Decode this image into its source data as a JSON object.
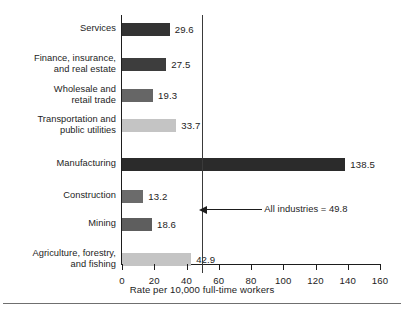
{
  "chart_data": {
    "type": "bar",
    "orientation": "horizontal",
    "title": "",
    "xlabel": "Rate per 10,000 full-time workers",
    "ylabel": "",
    "xlim": [
      0,
      160
    ],
    "xticks": [
      0,
      20,
      40,
      60,
      80,
      100,
      120,
      140,
      160
    ],
    "xtick_labels": [
      "0",
      "20",
      "40",
      "60",
      "80",
      "100",
      "120",
      "140",
      "160"
    ],
    "grid": false,
    "legend": null,
    "categories": [
      "Services",
      "Finance, insurance,\nand real estate",
      "Wholesale and\nretail trade",
      "Transportation and\npublic utilities",
      "Manufacturing",
      "Construction",
      "Mining",
      "Agriculture, forestry,\nand fishing"
    ],
    "values": [
      29.6,
      27.5,
      19.3,
      33.7,
      138.5,
      13.2,
      18.6,
      42.9
    ],
    "value_labels": [
      "29.6",
      "27.5",
      "19.3",
      "33.7",
      "138.5",
      "13.2",
      "18.6",
      "42.9"
    ],
    "bar_colors": [
      "#333333",
      "#3d3d3d",
      "#666666",
      "#c4c4c4",
      "#2b2b2b",
      "#6b6b6b",
      "#5e5e5e",
      "#c4c4c4"
    ],
    "reference_line": {
      "value": 49.8,
      "label": "All industries = 49.8",
      "color": "#3a3a3a"
    }
  },
  "colors": {
    "axis": "#1d1d1d",
    "text": "#1d1d1d",
    "background": "#ffffff",
    "rule": "#6f6f6f"
  }
}
